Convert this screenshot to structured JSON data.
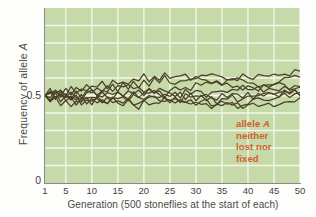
{
  "figure": {
    "background_color": "#fdfdfb",
    "plot_background_color": "#c6d9a9",
    "gridline_color": "#f2f6ea",
    "line_color": "#4a4026",
    "axis_color": "#8a8a84"
  },
  "annotation": {
    "line1_prefix": "allele ",
    "line1_italic": "A",
    "line2": "neither",
    "line3": "lost nor",
    "line4": "fixed",
    "color": "#cf5f28"
  },
  "chart_data": {
    "type": "line",
    "title": "",
    "xlabel": "Generation (500 stoneflies at the start of each)",
    "ylabel_prefix": "Frequency of allele ",
    "ylabel_italic": "A",
    "ylabel": "Frequency of allele A",
    "xlim": [
      1,
      50
    ],
    "ylim": [
      0,
      1
    ],
    "grid": true,
    "legend": "none",
    "xticks": [
      1,
      5,
      10,
      15,
      20,
      25,
      30,
      35,
      40,
      45,
      50
    ],
    "xtick_labels": [
      "1",
      "5",
      "10",
      "15",
      "20",
      "25",
      "30",
      "35",
      "40",
      "45",
      "50"
    ],
    "yticks": [
      0,
      0.5
    ],
    "ytick_labels": [
      "0",
      "0.5"
    ],
    "x": [
      1,
      2,
      3,
      4,
      5,
      6,
      7,
      8,
      9,
      10,
      11,
      12,
      13,
      14,
      15,
      16,
      17,
      18,
      19,
      20,
      21,
      22,
      23,
      24,
      25,
      26,
      27,
      28,
      29,
      30,
      31,
      32,
      33,
      34,
      35,
      36,
      37,
      38,
      39,
      40,
      41,
      42,
      43,
      44,
      45,
      46,
      47,
      48,
      49,
      50
    ],
    "series": [
      {
        "name": "population 1",
        "values": [
          0.5,
          0.52,
          0.5,
          0.53,
          0.51,
          0.54,
          0.52,
          0.55,
          0.53,
          0.56,
          0.54,
          0.57,
          0.55,
          0.58,
          0.56,
          0.59,
          0.57,
          0.6,
          0.58,
          0.61,
          0.59,
          0.62,
          0.6,
          0.63,
          0.61,
          0.62,
          0.6,
          0.61,
          0.59,
          0.6,
          0.58,
          0.59,
          0.57,
          0.58,
          0.56,
          0.57,
          0.55,
          0.56,
          0.54,
          0.55,
          0.53,
          0.54,
          0.55,
          0.56,
          0.57,
          0.58,
          0.59,
          0.6,
          0.61,
          0.62
        ]
      },
      {
        "name": "population 2",
        "values": [
          0.5,
          0.48,
          0.51,
          0.47,
          0.5,
          0.46,
          0.49,
          0.45,
          0.48,
          0.46,
          0.49,
          0.47,
          0.5,
          0.48,
          0.51,
          0.49,
          0.52,
          0.5,
          0.53,
          0.51,
          0.54,
          0.52,
          0.55,
          0.53,
          0.52,
          0.5,
          0.51,
          0.49,
          0.5,
          0.48,
          0.49,
          0.47,
          0.48,
          0.46,
          0.47,
          0.45,
          0.46,
          0.44,
          0.45,
          0.46,
          0.47,
          0.48,
          0.47,
          0.48,
          0.49,
          0.5,
          0.51,
          0.5,
          0.51,
          0.52
        ]
      },
      {
        "name": "population 3",
        "values": [
          0.5,
          0.51,
          0.49,
          0.52,
          0.48,
          0.51,
          0.47,
          0.5,
          0.46,
          0.49,
          0.45,
          0.48,
          0.46,
          0.49,
          0.47,
          0.5,
          0.48,
          0.51,
          0.49,
          0.52,
          0.5,
          0.53,
          0.51,
          0.49,
          0.47,
          0.48,
          0.46,
          0.47,
          0.45,
          0.46,
          0.44,
          0.45,
          0.43,
          0.44,
          0.45,
          0.46,
          0.44,
          0.45,
          0.43,
          0.44,
          0.45,
          0.44,
          0.45,
          0.46,
          0.45,
          0.46,
          0.47,
          0.46,
          0.47,
          0.48
        ]
      },
      {
        "name": "population 4",
        "values": [
          0.5,
          0.47,
          0.5,
          0.48,
          0.52,
          0.49,
          0.53,
          0.5,
          0.54,
          0.51,
          0.55,
          0.52,
          0.56,
          0.53,
          0.57,
          0.54,
          0.56,
          0.53,
          0.55,
          0.52,
          0.54,
          0.51,
          0.53,
          0.5,
          0.52,
          0.54,
          0.53,
          0.55,
          0.54,
          0.56,
          0.55,
          0.57,
          0.56,
          0.58,
          0.57,
          0.59,
          0.58,
          0.6,
          0.59,
          0.58,
          0.57,
          0.56,
          0.57,
          0.56,
          0.55,
          0.56,
          0.55,
          0.54,
          0.55,
          0.56
        ]
      },
      {
        "name": "population 5",
        "values": [
          0.5,
          0.53,
          0.49,
          0.52,
          0.47,
          0.5,
          0.46,
          0.49,
          0.47,
          0.5,
          0.48,
          0.51,
          0.49,
          0.47,
          0.48,
          0.46,
          0.47,
          0.45,
          0.46,
          0.47,
          0.48,
          0.49,
          0.47,
          0.48,
          0.46,
          0.47,
          0.48,
          0.46,
          0.47,
          0.45,
          0.46,
          0.47,
          0.45,
          0.46,
          0.47,
          0.48,
          0.49,
          0.47,
          0.48,
          0.49,
          0.5,
          0.49,
          0.5,
          0.51,
          0.5,
          0.51,
          0.52,
          0.51,
          0.52,
          0.5
        ]
      },
      {
        "name": "population 6",
        "values": [
          0.5,
          0.49,
          0.52,
          0.5,
          0.53,
          0.51,
          0.54,
          0.52,
          0.55,
          0.53,
          0.51,
          0.54,
          0.52,
          0.55,
          0.53,
          0.56,
          0.54,
          0.57,
          0.55,
          0.58,
          0.56,
          0.59,
          0.57,
          0.6,
          0.58,
          0.57,
          0.59,
          0.58,
          0.6,
          0.59,
          0.61,
          0.6,
          0.62,
          0.61,
          0.6,
          0.59,
          0.61,
          0.6,
          0.62,
          0.61,
          0.6,
          0.62,
          0.61,
          0.6,
          0.62,
          0.61,
          0.63,
          0.62,
          0.64,
          0.63
        ]
      },
      {
        "name": "population 7",
        "values": [
          0.5,
          0.46,
          0.49,
          0.45,
          0.48,
          0.44,
          0.47,
          0.45,
          0.48,
          0.46,
          0.49,
          0.47,
          0.45,
          0.48,
          0.46,
          0.44,
          0.47,
          0.45,
          0.43,
          0.46,
          0.44,
          0.47,
          0.45,
          0.48,
          0.46,
          0.49,
          0.47,
          0.5,
          0.48,
          0.51,
          0.49,
          0.52,
          0.5,
          0.48,
          0.51,
          0.49,
          0.52,
          0.5,
          0.48,
          0.51,
          0.49,
          0.52,
          0.5,
          0.53,
          0.51,
          0.49,
          0.52,
          0.5,
          0.53,
          0.51
        ]
      },
      {
        "name": "population 8",
        "values": [
          0.5,
          0.51,
          0.53,
          0.51,
          0.49,
          0.52,
          0.5,
          0.48,
          0.51,
          0.53,
          0.51,
          0.49,
          0.51,
          0.5,
          0.52,
          0.51,
          0.49,
          0.51,
          0.5,
          0.49,
          0.51,
          0.5,
          0.48,
          0.5,
          0.49,
          0.51,
          0.5,
          0.52,
          0.51,
          0.53,
          0.52,
          0.5,
          0.52,
          0.51,
          0.53,
          0.52,
          0.54,
          0.53,
          0.55,
          0.54,
          0.52,
          0.54,
          0.53,
          0.55,
          0.54,
          0.53,
          0.55,
          0.54,
          0.56,
          0.55
        ]
      }
    ]
  }
}
